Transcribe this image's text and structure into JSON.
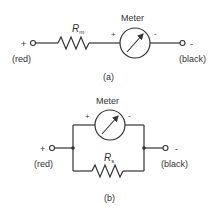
{
  "circuit_a": {
    "resistor_label": "R",
    "resistor_subscript": "m",
    "meter_label": "Meter",
    "meter_plus": "+",
    "meter_minus": "-",
    "terminal_left_sign": "+",
    "terminal_left_color": "(red)",
    "terminal_right_sign": "-",
    "terminal_right_color": "(black)",
    "caption": "(a)"
  },
  "circuit_b": {
    "resistor_label": "R",
    "resistor_subscript": "s",
    "meter_label": "Meter",
    "meter_plus": "+",
    "meter_minus": "-",
    "terminal_left_sign": "+",
    "terminal_left_color": "(red)",
    "terminal_right_sign": "-",
    "terminal_right_color": "(black)",
    "caption": "(b)"
  }
}
